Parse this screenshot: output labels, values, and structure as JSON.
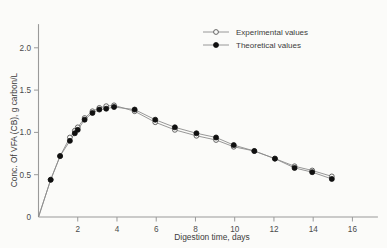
{
  "chart_data": {
    "type": "line",
    "title": "",
    "xlabel": "Digestion time, days",
    "ylabel": "Conc. Of VFA (CB), g carbon/L",
    "xlim": [
      0,
      17.3
    ],
    "ylim": [
      0,
      2.28
    ],
    "grid": false,
    "legend_position": "top-right",
    "xticks": [
      2,
      4,
      6,
      8,
      10,
      12,
      14,
      16
    ],
    "xtick_labels": [
      "2",
      "4",
      "6",
      "8",
      "10",
      "12",
      "14",
      "16"
    ],
    "yticks": [
      0,
      0.5,
      1.0,
      1.5,
      2.0
    ],
    "ytick_labels": [
      "0",
      "0.5",
      "1.0",
      "1.5",
      "2.0"
    ],
    "series": [
      {
        "name": "Experimental values",
        "marker": "open-circle",
        "x": [
          0.0,
          0.62,
          1.1,
          1.6,
          1.85,
          2.0,
          2.35,
          2.75,
          3.1,
          3.45,
          3.85,
          4.9,
          5.95,
          6.95,
          8.05,
          9.05,
          9.95,
          11.0,
          12.05,
          13.05,
          13.95,
          14.95
        ],
        "y": [
          0.0,
          0.44,
          0.72,
          0.94,
          1.02,
          1.06,
          1.17,
          1.25,
          1.29,
          1.31,
          1.32,
          1.25,
          1.12,
          1.03,
          0.96,
          0.91,
          0.83,
          0.78,
          0.69,
          0.6,
          0.55,
          0.48
        ]
      },
      {
        "name": "Theoretical values",
        "marker": "filled-circle",
        "x": [
          0.0,
          0.62,
          1.1,
          1.6,
          1.85,
          2.0,
          2.35,
          2.75,
          3.1,
          3.45,
          3.85,
          4.9,
          5.95,
          6.95,
          8.05,
          9.05,
          9.95,
          11.0,
          12.05,
          13.05,
          13.95,
          14.95
        ],
        "y": [
          0.0,
          0.44,
          0.72,
          0.9,
          0.99,
          1.03,
          1.15,
          1.23,
          1.27,
          1.28,
          1.3,
          1.27,
          1.15,
          1.06,
          0.99,
          0.94,
          0.85,
          0.78,
          0.69,
          0.58,
          0.53,
          0.45
        ]
      }
    ],
    "colors": {
      "line": "#8c8c8c",
      "open_marker_stroke": "#555555",
      "filled_marker": "#101010",
      "axis": "#9a9a9a",
      "background": "#fbfbf9",
      "text": "#3c3c3c"
    }
  },
  "legend": {
    "items": [
      {
        "label": "Experimental values",
        "marker": "open-circle"
      },
      {
        "label": "Theoretical values",
        "marker": "filled-circle"
      }
    ]
  }
}
